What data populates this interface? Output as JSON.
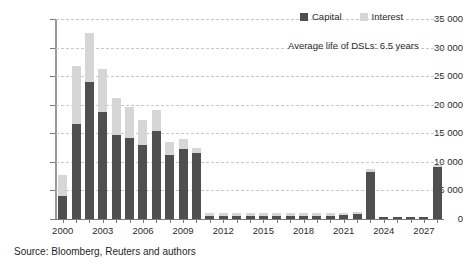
{
  "chart_data": {
    "type": "bar",
    "subtype": "stacked-bar",
    "title": "",
    "xlabel": "",
    "ylabel": "",
    "ylim": [
      0,
      35000
    ],
    "ytick_step": 5000,
    "ytick_labels": [
      "35 000",
      "30 000",
      "25 000",
      "20 000",
      "15 000",
      "10 000",
      "5 000",
      "0"
    ],
    "ytick_values": [
      35000,
      30000,
      25000,
      20000,
      15000,
      10000,
      5000,
      0
    ],
    "grid": true,
    "grid_style": "dashed",
    "legend_position": "top-right",
    "categories": [
      "2000",
      "2001",
      "2002",
      "2003",
      "2004",
      "2005",
      "2006",
      "2007",
      "2008",
      "2009",
      "2010",
      "2011",
      "2012",
      "2013",
      "2014",
      "2015",
      "2016",
      "2017",
      "2018",
      "2019",
      "2020",
      "2021",
      "2022",
      "2023",
      "2024",
      "2025",
      "2026",
      "2027",
      "2028"
    ],
    "xtick_labels": [
      "2000",
      "2003",
      "2006",
      "2009",
      "2012",
      "2015",
      "2018",
      "2021",
      "2024",
      "2027"
    ],
    "xtick_label_indices": [
      0,
      3,
      6,
      9,
      12,
      15,
      18,
      21,
      24,
      27
    ],
    "series": [
      {
        "name": "Capital",
        "color": "#4f4f4f",
        "values": [
          4100,
          16700,
          24000,
          18700,
          14700,
          14200,
          13000,
          15400,
          11200,
          12200,
          11600,
          600,
          600,
          600,
          600,
          600,
          600,
          600,
          600,
          600,
          600,
          700,
          800,
          8300,
          300,
          300,
          300,
          300,
          9100
        ]
      },
      {
        "name": "Interest",
        "color": "#d6d6d6",
        "values": [
          3600,
          10100,
          8600,
          7600,
          6500,
          5400,
          4300,
          3700,
          2300,
          1800,
          900,
          400,
          400,
          400,
          400,
          400,
          400,
          400,
          400,
          400,
          400,
          400,
          400,
          500,
          100,
          100,
          100,
          100,
          400
        ]
      }
    ],
    "totals": [
      7700,
      26800,
      32600,
      26300,
      21200,
      19600,
      17300,
      19100,
      13500,
      14000,
      12500,
      1000,
      1000,
      1000,
      1000,
      1000,
      1000,
      1000,
      1000,
      1000,
      1000,
      1100,
      1200,
      8800,
      400,
      400,
      400,
      400,
      9500
    ]
  },
  "legend": {
    "items": [
      {
        "label": "Capital",
        "color": "#4f4f4f"
      },
      {
        "label": "Interest",
        "color": "#d6d6d6"
      }
    ]
  },
  "annotation": {
    "text": "Average life of DSLs: 6.5 years"
  },
  "source": {
    "text": "Source: Bloomberg, Reuters and authors"
  }
}
